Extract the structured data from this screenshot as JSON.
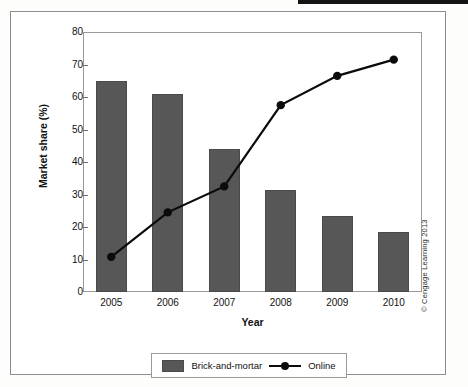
{
  "chart_data": {
    "type": "bar",
    "title": "",
    "subtitle": "",
    "xlabel": "Year",
    "ylabel": "Market share (%)",
    "categories": [
      "2005",
      "2006",
      "2007",
      "2008",
      "2009",
      "2010"
    ],
    "ylim": [
      0,
      80
    ],
    "yticks": [
      0,
      10,
      20,
      30,
      40,
      50,
      60,
      70,
      80
    ],
    "ytick_labels": [
      "0",
      "10",
      "20",
      "30",
      "40",
      "50",
      "60",
      "70",
      "80"
    ],
    "grid": false,
    "legend_position": "bottom-center",
    "series": [
      {
        "name": "Brick-and-mortar",
        "type": "bar",
        "color": "#575757",
        "values": [
          65,
          61,
          44,
          31.5,
          23.5,
          18.5
        ]
      },
      {
        "name": "Online",
        "type": "line",
        "color": "#0b0b0b",
        "marker": "circle",
        "values": [
          10.8,
          24.5,
          32.5,
          57.5,
          66.5,
          71.5
        ]
      }
    ]
  },
  "legend": {
    "items": [
      {
        "label": "Brick-and-mortar",
        "marker": "filled-square"
      },
      {
        "label": "Online",
        "marker": "line-with-dot"
      }
    ]
  },
  "axes": {
    "y_title": "Market share (%)",
    "x_title": "Year"
  },
  "credit": {
    "text": "© Cengage Learning 2013"
  },
  "colors": {
    "bar_fill": "#575757",
    "line": "#0b0b0b",
    "frame": "#9a9a9a",
    "outer_border": "#8d8d8d",
    "text": "#111111"
  }
}
